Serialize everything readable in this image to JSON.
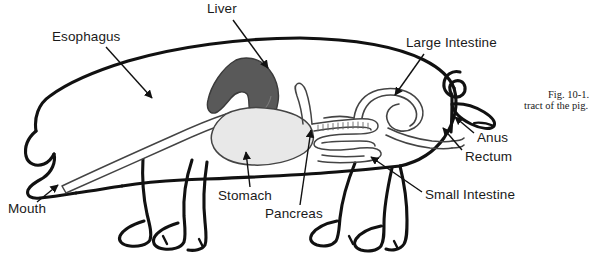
{
  "figure": {
    "domain": "diagram",
    "caption": {
      "line1": "Fig. 10-1.",
      "line2": "tract of the pig."
    },
    "colors": {
      "background": "#ffffff",
      "outline": "#111111",
      "organ_outline": "#444444",
      "liver_fill": "#595959",
      "stomach_fill": "#e8e8e8",
      "text": "#1a1a1a"
    },
    "labels": [
      {
        "id": "esophagus",
        "text": "Esophagus"
      },
      {
        "id": "liver",
        "text": "Liver"
      },
      {
        "id": "large_intestine",
        "text": "Large Intestine"
      },
      {
        "id": "anus",
        "text": "Anus"
      },
      {
        "id": "rectum",
        "text": "Rectum"
      },
      {
        "id": "small_intestine",
        "text": "Small Intestine"
      },
      {
        "id": "pancreas",
        "text": "Pancreas"
      },
      {
        "id": "stomach",
        "text": "Stomach"
      },
      {
        "id": "mouth",
        "text": "Mouth"
      }
    ]
  }
}
